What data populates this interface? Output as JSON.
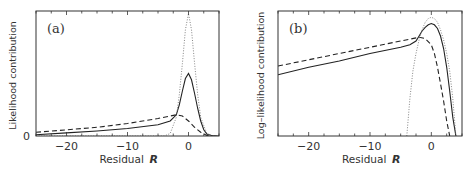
{
  "chart_data": [
    {
      "type": "line",
      "panel_label": "(a)",
      "title": "",
      "xlabel": "Residual",
      "xlabel_symbol": "R",
      "ylabel": "Likelihood contribution",
      "xlim": [
        -25,
        5
      ],
      "ylim": [
        0,
        1
      ],
      "xticks": [
        -20,
        -10,
        0
      ],
      "xtick_labels": [
        "−20",
        "−10",
        "0"
      ],
      "yticks": [
        0
      ],
      "ytick_labels": [
        "0"
      ],
      "grid": false,
      "legend": null,
      "series": [
        {
          "name": "solid",
          "style": "solid",
          "x": [
            -25,
            -20,
            -15,
            -10,
            -5,
            -3,
            -2,
            -1.5,
            -1,
            -0.5,
            0,
            0.5,
            1,
            1.5,
            2,
            2.5,
            3,
            4,
            5
          ],
          "y": [
            0.01,
            0.025,
            0.04,
            0.06,
            0.09,
            0.12,
            0.17,
            0.25,
            0.36,
            0.46,
            0.5,
            0.45,
            0.34,
            0.22,
            0.12,
            0.05,
            0.015,
            0.0,
            0.0
          ]
        },
        {
          "name": "dashed",
          "style": "dashed",
          "x": [
            -25,
            -20,
            -15,
            -10,
            -5,
            -3,
            -2,
            -1,
            0,
            1,
            2,
            3,
            4,
            5
          ],
          "y": [
            0.03,
            0.05,
            0.07,
            0.1,
            0.14,
            0.16,
            0.17,
            0.16,
            0.12,
            0.07,
            0.03,
            0.005,
            0.0,
            0.0
          ]
        },
        {
          "name": "dotted",
          "style": "dotted",
          "x": [
            -25,
            -4,
            -3,
            -2,
            -1.5,
            -1,
            -0.5,
            0,
            0.5,
            1,
            1.5,
            2,
            3,
            4,
            5
          ],
          "y": [
            0.0,
            0.0,
            0.02,
            0.15,
            0.33,
            0.58,
            0.85,
            0.98,
            0.85,
            0.58,
            0.33,
            0.15,
            0.02,
            0.0,
            0.0
          ]
        }
      ]
    },
    {
      "type": "line",
      "panel_label": "(b)",
      "title": "",
      "xlabel": "Residual",
      "xlabel_symbol": "R",
      "ylabel": "Log–likelihood contribution",
      "xlim": [
        -25,
        5
      ],
      "ylim": [
        0,
        1
      ],
      "xticks": [
        -20,
        -10,
        0
      ],
      "xtick_labels": [
        "−20",
        "−10",
        "0"
      ],
      "yticks": [],
      "ytick_labels": [],
      "grid": false,
      "legend": null,
      "series": [
        {
          "name": "solid",
          "style": "solid",
          "x": [
            -25,
            -20,
            -15,
            -10,
            -5,
            -3.5,
            -2.5,
            -2,
            -1.5,
            -1,
            -0.5,
            0,
            0.5,
            1,
            1.5,
            2,
            2.5,
            3,
            3.5,
            4
          ],
          "y": [
            0.49,
            0.55,
            0.6,
            0.66,
            0.71,
            0.73,
            0.76,
            0.8,
            0.84,
            0.87,
            0.89,
            0.9,
            0.89,
            0.86,
            0.8,
            0.7,
            0.55,
            0.36,
            0.15,
            0.0
          ]
        },
        {
          "name": "dashed",
          "style": "dashed",
          "x": [
            -25,
            -20,
            -15,
            -10,
            -5,
            -2,
            -1,
            0,
            0.5,
            1,
            1.5,
            2,
            2.5,
            3
          ],
          "y": [
            0.56,
            0.61,
            0.66,
            0.71,
            0.76,
            0.79,
            0.78,
            0.73,
            0.66,
            0.55,
            0.42,
            0.28,
            0.12,
            0.0
          ]
        },
        {
          "name": "dotted",
          "style": "dotted",
          "x": [
            -4,
            -3.5,
            -3,
            -2.5,
            -2,
            -1.5,
            -1,
            -0.5,
            0,
            0.5,
            1,
            1.5,
            2,
            2.5,
            3,
            3.5,
            4
          ],
          "y": [
            0.0,
            0.3,
            0.52,
            0.66,
            0.77,
            0.85,
            0.91,
            0.94,
            0.95,
            0.94,
            0.91,
            0.85,
            0.77,
            0.66,
            0.52,
            0.3,
            0.0
          ]
        }
      ]
    }
  ],
  "layout": {
    "panels": [
      {
        "left": 36,
        "top": 11,
        "right": 219,
        "bottom": 136
      },
      {
        "left": 278,
        "top": 11,
        "right": 462,
        "bottom": 136
      }
    ]
  }
}
